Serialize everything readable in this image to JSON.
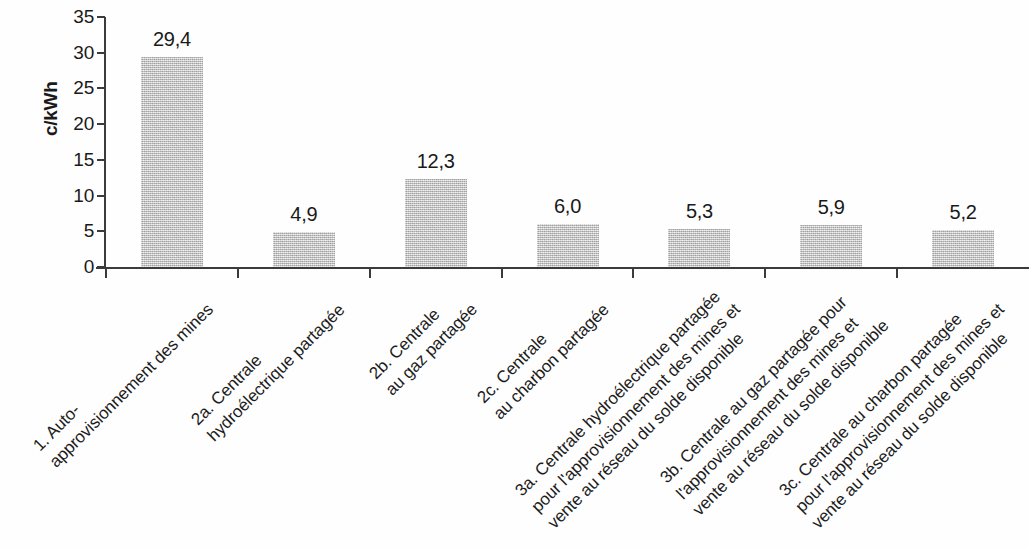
{
  "chart_data": {
    "type": "bar",
    "title": "",
    "subtitle": "",
    "xlabel": "",
    "ylabel": "c/kWh",
    "ylim": [
      0,
      35
    ],
    "ytick_step": 5,
    "yticks": [
      "35",
      "30",
      "25",
      "20",
      "15",
      "10",
      "5",
      "0"
    ],
    "grid": false,
    "legend": "none",
    "decimal_separator": ",",
    "bar_color": "#b9b9b9",
    "axis_color": "#3b3b3b",
    "text_color": "#1a1a1a",
    "categories": [
      "1. Auto-approvisionnement des mines",
      "2a. Centrale hydroélectrique partagée",
      "2b. Centrale au gaz partagée",
      "2c. Centrale au charbon partagée",
      "3a. Centrale hydroélectrique partagée pour l'approvisionnement des mines et vente au réseau du solde disponible",
      "3b. Centrale au gaz partagée pour l'approvisionnement des mines et vente au réseau du solde disponible",
      "3c. Centrale au charbon partagée pour l'approvisionnement des mines et vente au réseau du solde disponible"
    ],
    "category_lines": [
      [
        "1. Auto-",
        "approvisionnement des mines"
      ],
      [
        "2a. Centrale",
        "hydroélectrique partagée"
      ],
      [
        "2b. Centrale",
        "au gaz partagée"
      ],
      [
        "2c. Centrale",
        "au charbon partagée"
      ],
      [
        "3a. Centrale hydroélectrique partagée",
        "pour l'approvisionnement des mines et",
        "vente au réseau du solde disponible"
      ],
      [
        "3b. Centrale au gaz partagée pour",
        "l'approvisionnement des mines et",
        "vente au réseau du solde disponible"
      ],
      [
        "3c. Centrale au charbon partagée",
        "pour l'approvisionnement des mines et",
        "vente au réseau du solde disponible"
      ]
    ],
    "values": [
      29.4,
      4.9,
      12.3,
      6.0,
      5.3,
      5.9,
      5.2
    ],
    "value_labels": [
      "29,4",
      "4,9",
      "12,3",
      "6,0",
      "5,3",
      "5,9",
      "5,2"
    ]
  }
}
